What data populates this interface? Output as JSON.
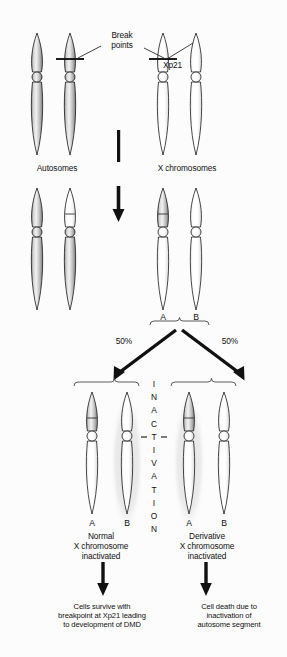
{
  "figure": {
    "type": "diagram",
    "background": "#fcfcfc",
    "colors": {
      "autosome_fill": "#b9b9b9",
      "x_fill": "#ffffff",
      "outline": "#1a1a1a",
      "inactivation_halo": "#ececec",
      "arrow": "#111111"
    }
  },
  "top_row": {
    "breakpoints_label": "Break\npoints",
    "xp21_label": "Xp21",
    "autosomes_label": "Autosomes",
    "x_chromosomes_label": "X chromosomes"
  },
  "middle_row": {
    "gamete_labels": [
      "A",
      "B"
    ]
  },
  "split": {
    "left_percent": "50%",
    "right_percent": "50%"
  },
  "inactivation": {
    "vertical_text": "INACTIVATION",
    "letters": [
      "I",
      "N",
      "A",
      "C",
      "T",
      "I",
      "V",
      "A",
      "T",
      "I",
      "O",
      "N"
    ]
  },
  "outcomes": {
    "left": {
      "chromosome_labels": [
        "A",
        "B"
      ],
      "caption": "Normal\nX chromosome\ninactivated",
      "result": "Cells survive with\nbreakpoint at Xp21 leading\nto development of DMD"
    },
    "right": {
      "chromosome_labels": [
        "A",
        "B"
      ],
      "caption": "Derivative\nX chromosome\ninactivated",
      "result": "Cell death due to\ninactivation of\nautosome segment"
    }
  }
}
